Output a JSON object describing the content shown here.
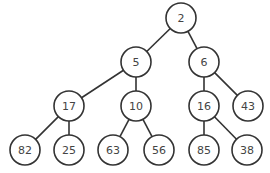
{
  "diagram": {
    "type": "binary-tree",
    "colors": {
      "stroke": "#333333",
      "fill": "#ffffff",
      "text": "#444444"
    },
    "node_radius": 15,
    "nodes": [
      {
        "id": "n2",
        "label": "2",
        "x": 181,
        "y": 18
      },
      {
        "id": "n5",
        "label": "5",
        "x": 136,
        "y": 62
      },
      {
        "id": "n6",
        "label": "6",
        "x": 204,
        "y": 62
      },
      {
        "id": "n17",
        "label": "17",
        "x": 69,
        "y": 106
      },
      {
        "id": "n10",
        "label": "10",
        "x": 136,
        "y": 106
      },
      {
        "id": "n16",
        "label": "16",
        "x": 204,
        "y": 106
      },
      {
        "id": "n43",
        "label": "43",
        "x": 248,
        "y": 106
      },
      {
        "id": "n82",
        "label": "82",
        "x": 25,
        "y": 150
      },
      {
        "id": "n25",
        "label": "25",
        "x": 69,
        "y": 150
      },
      {
        "id": "n63",
        "label": "63",
        "x": 113,
        "y": 150
      },
      {
        "id": "n56",
        "label": "56",
        "x": 159,
        "y": 150
      },
      {
        "id": "n85",
        "label": "85",
        "x": 204,
        "y": 150
      },
      {
        "id": "n38",
        "label": "38",
        "x": 247,
        "y": 150
      }
    ],
    "edges": [
      [
        "n2",
        "n5"
      ],
      [
        "n2",
        "n6"
      ],
      [
        "n5",
        "n17"
      ],
      [
        "n5",
        "n10"
      ],
      [
        "n6",
        "n16"
      ],
      [
        "n6",
        "n43"
      ],
      [
        "n17",
        "n82"
      ],
      [
        "n17",
        "n25"
      ],
      [
        "n10",
        "n63"
      ],
      [
        "n10",
        "n56"
      ],
      [
        "n16",
        "n85"
      ],
      [
        "n16",
        "n38"
      ]
    ]
  }
}
